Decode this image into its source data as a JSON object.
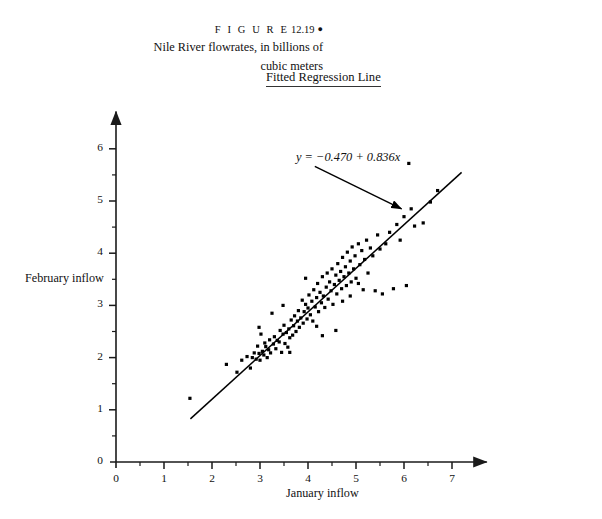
{
  "figure": {
    "label_spaced": "F I G U R E",
    "number": "12.19",
    "bullet": "●",
    "caption_line1": "Nile River flowrates, in billions of",
    "caption_line2": "cubic meters"
  },
  "chart_title": "Fitted Regression Line",
  "annotation": {
    "equation_prefix": "y",
    "equation": "y = −0.470 + 0.836x",
    "equation_lhs": "y",
    "equation_eq": " = ",
    "equation_intercept": "−0.470",
    "equation_plus": " + ",
    "equation_slope": "0.836",
    "equation_var": "x"
  },
  "axes": {
    "x_label": "January inflow",
    "y_label": "February inflow",
    "x_origin_label": "0",
    "y_origin_label": "0",
    "x_ticks": [
      "1",
      "2",
      "3",
      "4",
      "5",
      "6",
      "7"
    ],
    "y_ticks": [
      "1",
      "2",
      "3",
      "4",
      "5",
      "6"
    ]
  },
  "colors": {
    "axis": "#1a1a1a",
    "point": "#000000",
    "line": "#000000",
    "text": "#111111",
    "background": "#ffffff"
  },
  "chart_data": {
    "type": "scatter",
    "title": "Fitted Regression Line",
    "xlabel": "January inflow",
    "ylabel": "February inflow",
    "xlim": [
      0,
      7.6
    ],
    "ylim": [
      0,
      6.6
    ],
    "grid": false,
    "legend": null,
    "x_ticks_major": [
      0,
      1,
      2,
      3,
      4,
      5,
      6,
      7
    ],
    "y_ticks_major": [
      0,
      1,
      2,
      3,
      4,
      5,
      6
    ],
    "x_minor_ticks": true,
    "y_minor_ticks": true,
    "annotations": [
      {
        "text": "y = −0.470 + 0.836x",
        "x": 4.1,
        "y": 5.55,
        "arrow_to": [
          5.95,
          4.85
        ]
      }
    ],
    "fit_line": {
      "type": "line",
      "intercept": -0.47,
      "slope": 0.836,
      "x_start": 1.55,
      "x_end": 7.2,
      "equation": "y = -0.470 + 0.836x"
    },
    "series": [
      {
        "name": "Nile flowrates",
        "marker": "square",
        "points": [
          [
            1.54,
            1.22
          ],
          [
            2.3,
            1.87
          ],
          [
            2.52,
            1.72
          ],
          [
            2.62,
            1.95
          ],
          [
            2.73,
            2.02
          ],
          [
            2.8,
            1.8
          ],
          [
            2.84,
            2.0
          ],
          [
            2.88,
            2.09
          ],
          [
            2.92,
            1.97
          ],
          [
            2.95,
            2.22
          ],
          [
            2.98,
            2.08
          ],
          [
            3.0,
            1.95
          ],
          [
            3.02,
            2.45
          ],
          [
            3.05,
            2.12
          ],
          [
            3.08,
            2.05
          ],
          [
            3.1,
            2.28
          ],
          [
            3.12,
            2.21
          ],
          [
            3.15,
            2.0
          ],
          [
            3.18,
            2.15
          ],
          [
            3.2,
            2.34
          ],
          [
            3.22,
            2.09
          ],
          [
            3.25,
            2.85
          ],
          [
            3.28,
            2.26
          ],
          [
            3.3,
            2.4
          ],
          [
            3.33,
            2.17
          ],
          [
            3.36,
            2.33
          ],
          [
            3.4,
            2.3
          ],
          [
            3.42,
            2.52
          ],
          [
            3.45,
            2.1
          ],
          [
            3.48,
            2.45
          ],
          [
            3.5,
            2.62
          ],
          [
            3.52,
            2.27
          ],
          [
            3.55,
            2.48
          ],
          [
            3.58,
            2.2
          ],
          [
            3.6,
            2.55
          ],
          [
            3.62,
            2.38
          ],
          [
            3.65,
            2.72
          ],
          [
            3.68,
            2.43
          ],
          [
            3.7,
            2.61
          ],
          [
            3.72,
            2.8
          ],
          [
            3.75,
            2.5
          ],
          [
            3.78,
            2.7
          ],
          [
            3.8,
            2.9
          ],
          [
            3.82,
            2.58
          ],
          [
            3.85,
            2.76
          ],
          [
            3.88,
            3.1
          ],
          [
            3.9,
            2.66
          ],
          [
            3.92,
            2.88
          ],
          [
            3.95,
            3.02
          ],
          [
            3.98,
            2.74
          ],
          [
            4.0,
            2.95
          ],
          [
            4.02,
            3.2
          ],
          [
            4.05,
            2.82
          ],
          [
            4.08,
            3.08
          ],
          [
            4.1,
            2.7
          ],
          [
            4.12,
            3.3
          ],
          [
            4.15,
            2.97
          ],
          [
            4.18,
            3.15
          ],
          [
            4.2,
            3.42
          ],
          [
            4.22,
            2.88
          ],
          [
            4.25,
            3.25
          ],
          [
            4.28,
            3.05
          ],
          [
            4.3,
            3.55
          ],
          [
            4.32,
            3.18
          ],
          [
            4.35,
            2.96
          ],
          [
            4.38,
            3.35
          ],
          [
            4.4,
            3.62
          ],
          [
            4.42,
            3.12
          ],
          [
            4.45,
            3.45
          ],
          [
            4.48,
            3.28
          ],
          [
            4.5,
            3.7
          ],
          [
            4.52,
            3.02
          ],
          [
            4.55,
            3.4
          ],
          [
            4.58,
            3.58
          ],
          [
            4.6,
            3.22
          ],
          [
            4.62,
            3.8
          ],
          [
            4.65,
            3.48
          ],
          [
            4.68,
            3.65
          ],
          [
            4.7,
            3.32
          ],
          [
            4.72,
            3.92
          ],
          [
            4.75,
            3.55
          ],
          [
            4.78,
            3.74
          ],
          [
            4.8,
            3.38
          ],
          [
            4.82,
            4.02
          ],
          [
            4.85,
            3.62
          ],
          [
            4.88,
            3.85
          ],
          [
            4.9,
            3.45
          ],
          [
            4.92,
            4.12
          ],
          [
            4.95,
            3.7
          ],
          [
            4.98,
            3.95
          ],
          [
            5.0,
            3.52
          ],
          [
            5.05,
            4.18
          ],
          [
            5.08,
            3.78
          ],
          [
            5.12,
            4.05
          ],
          [
            5.15,
            3.3
          ],
          [
            5.18,
            3.88
          ],
          [
            5.22,
            4.25
          ],
          [
            5.25,
            3.62
          ],
          [
            5.3,
            4.1
          ],
          [
            5.35,
            3.95
          ],
          [
            5.4,
            3.28
          ],
          [
            5.45,
            4.35
          ],
          [
            5.5,
            4.08
          ],
          [
            5.55,
            3.22
          ],
          [
            5.62,
            4.18
          ],
          [
            5.7,
            4.4
          ],
          [
            5.78,
            3.32
          ],
          [
            5.85,
            4.55
          ],
          [
            5.92,
            4.25
          ],
          [
            6.0,
            4.7
          ],
          [
            6.05,
            3.38
          ],
          [
            6.1,
            5.72
          ],
          [
            6.15,
            4.85
          ],
          [
            6.22,
            4.52
          ],
          [
            6.4,
            4.58
          ],
          [
            6.55,
            4.98
          ],
          [
            6.7,
            5.2
          ],
          [
            3.95,
            3.52
          ],
          [
            4.18,
            2.6
          ],
          [
            4.58,
            2.52
          ],
          [
            4.88,
            3.18
          ],
          [
            5.05,
            3.42
          ],
          [
            3.48,
            3.0
          ],
          [
            3.62,
            2.1
          ],
          [
            2.98,
            2.58
          ],
          [
            4.3,
            2.42
          ],
          [
            4.72,
            3.08
          ]
        ]
      }
    ]
  }
}
